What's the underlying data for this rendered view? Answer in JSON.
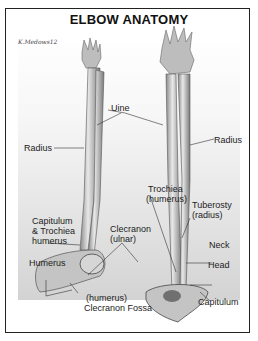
{
  "title": "ELBOW ANATOMY",
  "signature": "K.Medows12",
  "labels": {
    "uine": "Uine",
    "radius_left": "Radius",
    "radius_right": "Radius",
    "trochiea_1": "Trochiea",
    "trochiea_2": "(humerus)",
    "tuberosty_1": "Tuberosty",
    "tuberosty_2": "(radius)",
    "capitulum_left_1": "Capitulum",
    "capitulum_left_2": "& Trochiea",
    "capitulum_left_3": "humerus",
    "clecranon_1": "Clecranon",
    "clecranon_2": "(ulnar)",
    "neck": "Neck",
    "humerus": "Humerus",
    "head": "Head",
    "fossa_1": "(humerus)",
    "fossa_2": "Clecranon Fossa",
    "capitulum_right": "Capitulum"
  },
  "colors": {
    "border": "#222222",
    "text": "#222222",
    "bone_shade": "#6a6a6a"
  }
}
